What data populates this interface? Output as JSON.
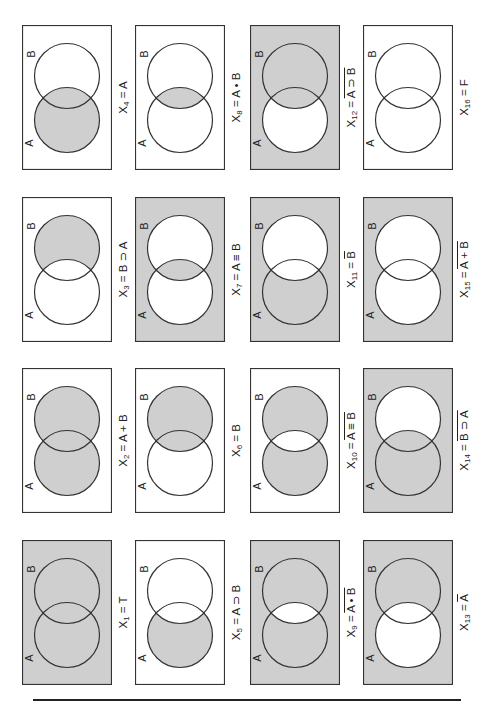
{
  "figure": {
    "colors": {
      "shade": "#cfcfcf",
      "stroke": "#333333",
      "blank": "#ffffff"
    },
    "set_labels": {
      "a": "A",
      "b": "B"
    },
    "layout": {
      "columns_x": [
        22,
        135,
        250,
        363
      ],
      "rows_y": [
        25,
        197,
        368,
        540
      ],
      "panel_width": 90,
      "panel_height": 145
    },
    "panels": [
      {
        "id": "X1",
        "col": 0,
        "row": 3,
        "sub": "1",
        "expr": "T",
        "overline": false,
        "shade": {
          "outside": 1,
          "a_only": 1,
          "b_only": 1,
          "both": 1
        }
      },
      {
        "id": "X2",
        "col": 0,
        "row": 2,
        "sub": "2",
        "expr": "A + B",
        "overline": false,
        "shade": {
          "outside": 0,
          "a_only": 1,
          "b_only": 1,
          "both": 1
        }
      },
      {
        "id": "X3",
        "col": 0,
        "row": 1,
        "sub": "3",
        "expr": "B ⊃ A",
        "overline": false,
        "shade": {
          "outside": 0,
          "a_only": 0,
          "b_only": 1,
          "both": 0
        }
      },
      {
        "id": "X4",
        "col": 0,
        "row": 0,
        "sub": "4",
        "expr": "A",
        "overline": false,
        "shade": {
          "outside": 0,
          "a_only": 1,
          "b_only": 0,
          "both": 1
        }
      },
      {
        "id": "X5",
        "col": 1,
        "row": 3,
        "sub": "5",
        "expr": "A ⊃ B",
        "overline": false,
        "shade": {
          "outside": 0,
          "a_only": 1,
          "b_only": 0,
          "both": 0
        }
      },
      {
        "id": "X6",
        "col": 1,
        "row": 2,
        "sub": "6",
        "expr": "B",
        "overline": false,
        "shade": {
          "outside": 0,
          "a_only": 0,
          "b_only": 1,
          "both": 1
        }
      },
      {
        "id": "X7",
        "col": 1,
        "row": 1,
        "sub": "7",
        "expr": "A ≡ B",
        "overline": false,
        "shade": {
          "outside": 1,
          "a_only": 0,
          "b_only": 0,
          "both": 1
        }
      },
      {
        "id": "X8",
        "col": 1,
        "row": 0,
        "sub": "8",
        "expr": "A • B",
        "overline": false,
        "shade": {
          "outside": 0,
          "a_only": 0,
          "b_only": 0,
          "both": 1
        }
      },
      {
        "id": "X9",
        "col": 2,
        "row": 3,
        "sub": "9",
        "expr": "A • B",
        "overline": true,
        "shade": {
          "outside": 1,
          "a_only": 1,
          "b_only": 1,
          "both": 0
        }
      },
      {
        "id": "X10",
        "col": 2,
        "row": 2,
        "sub": "10",
        "expr": "A ≡ B",
        "overline": true,
        "shade": {
          "outside": 0,
          "a_only": 1,
          "b_only": 1,
          "both": 0
        }
      },
      {
        "id": "X11",
        "col": 2,
        "row": 1,
        "sub": "11",
        "expr": "B",
        "overline": true,
        "shade": {
          "outside": 1,
          "a_only": 1,
          "b_only": 0,
          "both": 0
        }
      },
      {
        "id": "X12",
        "col": 2,
        "row": 0,
        "sub": "12",
        "expr": "A ⊃ B",
        "overline": true,
        "shade": {
          "outside": 1,
          "a_only": 0,
          "b_only": 1,
          "both": 1
        }
      },
      {
        "id": "X13",
        "col": 3,
        "row": 3,
        "sub": "13",
        "expr": "A",
        "overline": true,
        "shade": {
          "outside": 1,
          "a_only": 0,
          "b_only": 1,
          "both": 0
        }
      },
      {
        "id": "X14",
        "col": 3,
        "row": 2,
        "sub": "14",
        "expr": "B ⊃ A",
        "overline": true,
        "shade": {
          "outside": 1,
          "a_only": 1,
          "b_only": 0,
          "both": 1
        }
      },
      {
        "id": "X15",
        "col": 3,
        "row": 1,
        "sub": "15",
        "expr": "A + B",
        "overline": true,
        "shade": {
          "outside": 1,
          "a_only": 0,
          "b_only": 0,
          "both": 0
        }
      },
      {
        "id": "X16",
        "col": 3,
        "row": 0,
        "sub": "16",
        "expr": "F",
        "overline": false,
        "shade": {
          "outside": 0,
          "a_only": 0,
          "b_only": 0,
          "both": 0
        }
      }
    ],
    "label_prefix": "X",
    "label_equals": " = "
  }
}
